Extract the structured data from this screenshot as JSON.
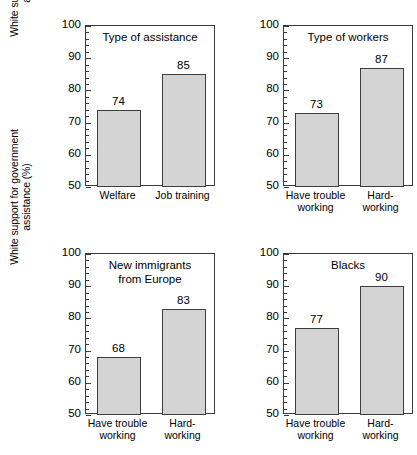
{
  "chart_data": {
    "type": "bar",
    "title": "",
    "ylabel": "White support for government assistance (%)",
    "ylabel_lines": [
      "White support for government",
      "assistance (%)"
    ],
    "ylim": [
      50,
      100
    ],
    "yticks": [
      50,
      60,
      70,
      80,
      90,
      100
    ],
    "ytick_labels": [
      "50",
      "60",
      "70",
      "80",
      "90",
      "100"
    ],
    "minor_tick_step": 2,
    "grid": false,
    "legend": null,
    "bar_fill_color": "#d4d4d4",
    "bar_edge_color": "#3d3d3d",
    "axis_color": "#3a3a3a",
    "background_color": "#ffffff",
    "panels": [
      {
        "id": "type-of-assistance",
        "title": "Type of assistance",
        "title_lines": [
          "Type of assistance"
        ],
        "categories": [
          "Welfare",
          "Job training"
        ],
        "category_lines": [
          [
            "Welfare"
          ],
          [
            "Job training"
          ]
        ],
        "values": [
          74,
          85
        ],
        "value_labels": [
          "74",
          "85"
        ]
      },
      {
        "id": "type-of-workers",
        "title": "Type of workers",
        "title_lines": [
          "Type of workers"
        ],
        "categories": [
          "Have trouble working",
          "Hard-working"
        ],
        "category_lines": [
          [
            "Have trouble",
            "working"
          ],
          [
            "Hard-",
            "working"
          ]
        ],
        "values": [
          73,
          87
        ],
        "value_labels": [
          "73",
          "87"
        ]
      },
      {
        "id": "new-immigrants-from-europe",
        "title": "New immigrants from Europe",
        "title_lines": [
          "New immigrants",
          "from Europe"
        ],
        "categories": [
          "Have trouble working",
          "Hard-working"
        ],
        "category_lines": [
          [
            "Have trouble",
            "working"
          ],
          [
            "Hard-",
            "working"
          ]
        ],
        "values": [
          68,
          83
        ],
        "value_labels": [
          "68",
          "83"
        ]
      },
      {
        "id": "blacks",
        "title": "Blacks",
        "title_lines": [
          "Blacks"
        ],
        "categories": [
          "Have trouble working",
          "Hard-working"
        ],
        "category_lines": [
          [
            "Have trouble",
            "working"
          ],
          [
            "Hard-",
            "working"
          ]
        ],
        "values": [
          77,
          90
        ],
        "value_labels": [
          "77",
          "90"
        ]
      }
    ]
  }
}
